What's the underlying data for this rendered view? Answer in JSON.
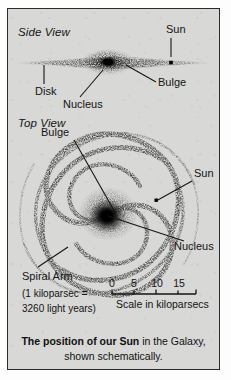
{
  "figure": {
    "caption_bold": "The position of our Sun",
    "caption_rest": " in the Galaxy, shown schematically.",
    "background_color": "#d8d8d6",
    "ink_color": "#141414",
    "border_color": "#2a2a2a"
  },
  "side_view": {
    "title": "Side View",
    "labels": {
      "sun": "Sun",
      "disk": "Disk",
      "nucleus": "Nucleus",
      "bulge": "Bulge"
    }
  },
  "top_view": {
    "title": "Top View",
    "labels": {
      "bulge": "Bulge",
      "sun": "Sun",
      "nucleus": "Nucleus",
      "spiral_arm": "Spiral Arm"
    }
  },
  "scale": {
    "caption": "Scale in kiloparsecs",
    "ticks": [
      "0",
      "5",
      "10",
      "15"
    ],
    "note_line1": "(1 kiloparsec  =",
    "note_line2": "3260 light years)"
  }
}
